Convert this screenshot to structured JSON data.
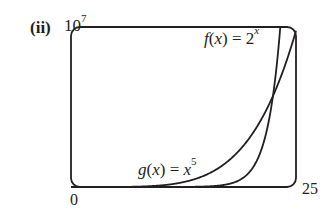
{
  "figure": {
    "part_label": "(ii)",
    "y_max_label": {
      "base": "10",
      "exp": "7"
    },
    "x_min_label": "0",
    "x_max_label": "25"
  },
  "curves": {
    "f": {
      "lhs_fn": "f",
      "lhs_var": "x",
      "eq": " = ",
      "base": "2",
      "exp": "x"
    },
    "g": {
      "lhs_fn": "g",
      "lhs_var": "x",
      "eq": " = ",
      "base": "x",
      "exp": "5"
    }
  },
  "colors": {
    "stroke": "#231f20",
    "background": "#ffffff"
  },
  "chart_data": {
    "type": "line",
    "title": "(ii)",
    "xlabel": "",
    "ylabel": "",
    "xlim": [
      0,
      25
    ],
    "ylim": [
      0,
      10000000
    ],
    "x_tick_labels": [
      "0",
      "25"
    ],
    "y_tick_labels": [
      "10^7"
    ],
    "grid": false,
    "legend": "inline annotations",
    "series": [
      {
        "name": "f(x) = 2^x",
        "formula": "2^x",
        "x": [
          0,
          5,
          10,
          15,
          18,
          20,
          22,
          23,
          23.25
        ],
        "values": [
          1,
          32,
          1024,
          32768,
          262144,
          1048576,
          4194304,
          8388608,
          10000000
        ]
      },
      {
        "name": "g(x) = x^5",
        "formula": "x^5",
        "x": [
          0,
          5,
          10,
          15,
          20,
          22.5,
          25
        ],
        "values": [
          0,
          3125,
          100000,
          759375,
          3200000,
          5766504,
          9765625
        ]
      }
    ],
    "annotations": [
      {
        "text": "f(x) = 2^x",
        "near": "top right"
      },
      {
        "text": "g(x) = x^5",
        "near": "bottom center"
      }
    ]
  }
}
